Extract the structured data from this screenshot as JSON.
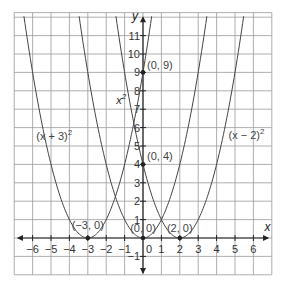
{
  "chart_data": {
    "type": "line",
    "title": "",
    "xlabel": "x",
    "ylabel": "y",
    "xlim": [
      -7,
      7
    ],
    "ylim": [
      -2,
      12.25
    ],
    "grid": true,
    "x_ticks": [
      "-6",
      "-5",
      "-4",
      "-3",
      "-2",
      "-1",
      "0",
      "1",
      "2",
      "3",
      "4",
      "5",
      "6"
    ],
    "y_ticks": [
      "-1",
      "1",
      "2",
      "3",
      "4",
      "5",
      "6",
      "7",
      "8",
      "9",
      "10",
      "11"
    ],
    "series": [
      {
        "name": "x²",
        "label_main": "x",
        "label_sup": "2",
        "expr": "x^2",
        "shift": 0
      },
      {
        "name": "(x + 3)²",
        "label_main": "(x + 3)",
        "label_sup": "2",
        "expr": "(x+3)^2",
        "shift": -3
      },
      {
        "name": "(x − 2)²",
        "label_main": "(x − 2)",
        "label_sup": "2",
        "expr": "(x-2)^2",
        "shift": 2
      }
    ],
    "points": [
      {
        "x": 0,
        "y": 9,
        "label": "(0, 9)"
      },
      {
        "x": 0,
        "y": 4,
        "label": "(0, 4)"
      },
      {
        "x": -3,
        "y": 0,
        "label": "(−3, 0)"
      },
      {
        "x": 0,
        "y": 0,
        "label": "(0, 0)"
      },
      {
        "x": 2,
        "y": 0,
        "label": "(2, 0)"
      }
    ],
    "colors": {
      "grid": "#999999",
      "grid_minor": "#cccccc",
      "curve": "#444444",
      "axis": "#222222"
    }
  }
}
